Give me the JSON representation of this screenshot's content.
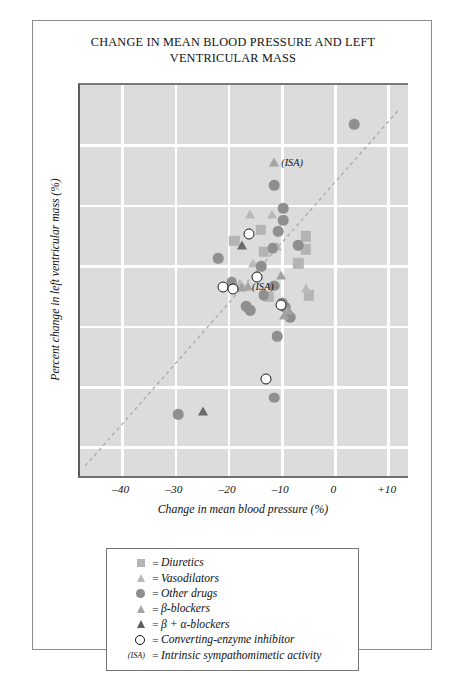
{
  "chart_data": {
    "type": "scatter",
    "title": "CHANGE IN MEAN BLOOD PRESSURE AND LEFT VENTRICULAR MASS",
    "title_lines": [
      "CHANGE IN MEAN BLOOD PRESSURE AND LEFT",
      "VENTRICULAR MASS"
    ],
    "xlabel": "Change in mean blood pressure (%)",
    "ylabel": "Percent change in left ventricular mass (%)",
    "xlim": [
      -48,
      14
    ],
    "ylim": [
      -45,
      20
    ],
    "xticks": [
      -40,
      -30,
      -20,
      -10,
      0,
      10
    ],
    "xtick_labels": [
      "–40",
      "–30",
      "–20",
      "–10",
      "0",
      "+10"
    ],
    "yticks": [
      20,
      10,
      0,
      -10,
      -20,
      -30,
      -40
    ],
    "ytick_labels": [
      "+20",
      "+10",
      "0",
      "–10",
      "–20",
      "–30",
      "–40"
    ],
    "grid": "white gridlines on gray panel, both axes",
    "legend_position": "below plot, bordered box",
    "reference_line": {
      "label": "identity line",
      "style": "dashed",
      "from": [
        -47,
        -43
      ],
      "to": [
        12,
        16
      ]
    },
    "annotations": [
      {
        "text": "(ISA)",
        "x": -11.5,
        "y": 7.2
      },
      {
        "text": "(ISA)",
        "x": -17.0,
        "y": -13.2
      }
    ],
    "series": [
      {
        "name": "Diuretics",
        "marker": "filled-square",
        "color": "#b4b4b4",
        "points": [
          [
            -19.0,
            -5.8
          ],
          [
            -14.0,
            -4.0
          ],
          [
            -13.5,
            -7.6
          ],
          [
            -5.6,
            -5.0
          ],
          [
            -5.6,
            -7.2
          ],
          [
            -7.0,
            -9.5
          ],
          [
            -12.5,
            -15.0
          ],
          [
            -5.0,
            -14.8
          ]
        ]
      },
      {
        "name": "Vasodilators",
        "marker": "filled-triangle-light",
        "color": "#b9b9b9",
        "points": [
          [
            -16.0,
            -1.4
          ],
          [
            -12.0,
            -1.4
          ],
          [
            -18.0,
            -12.8
          ],
          [
            -15.5,
            -9.5
          ],
          [
            -14.5,
            -11.2
          ],
          [
            -11.0,
            -6.6
          ],
          [
            -5.5,
            -13.5
          ]
        ]
      },
      {
        "name": "Other drugs",
        "marker": "filled-circle",
        "color": "#8f8f8f",
        "points": [
          [
            3.5,
            13.5
          ],
          [
            -11.5,
            3.4
          ],
          [
            -9.8,
            -0.4
          ],
          [
            -9.8,
            -2.4
          ],
          [
            -10.8,
            -4.2
          ],
          [
            -11.8,
            -7.0
          ],
          [
            -7.0,
            -6.5
          ],
          [
            -22.0,
            -8.6
          ],
          [
            -19.5,
            -12.6
          ],
          [
            -14.0,
            -10.0
          ],
          [
            -11.5,
            -13.2
          ],
          [
            -13.5,
            -14.8
          ],
          [
            -10.0,
            -16.0
          ],
          [
            -16.8,
            -16.6
          ],
          [
            -16.0,
            -17.2
          ],
          [
            -9.5,
            -16.8
          ],
          [
            -9.0,
            -17.8
          ],
          [
            -8.5,
            -18.4
          ],
          [
            -11.0,
            -21.5
          ],
          [
            -11.5,
            -31.7
          ],
          [
            -29.6,
            -34.4
          ]
        ]
      },
      {
        "name": "β-blockers",
        "marker": "filled-triangle-mid",
        "color": "#a3a3a3",
        "points": [
          [
            -11.5,
            7.2
          ],
          [
            -16.5,
            -13.2
          ],
          [
            -17.6,
            -13.4
          ],
          [
            -18.6,
            -13.2
          ],
          [
            -10.2,
            -11.5
          ],
          [
            -9.0,
            -17.2
          ],
          [
            -9.6,
            -18.0
          ]
        ]
      },
      {
        "name": "β + α-blockers",
        "marker": "filled-triangle-dark",
        "color": "#6a6a6a",
        "points": [
          [
            -17.6,
            -6.4
          ],
          [
            -24.8,
            -34.0
          ]
        ]
      },
      {
        "name": "Converting-enzyme inhibitor",
        "marker": "open-circle",
        "color": "#ffffff",
        "points": [
          [
            -16.2,
            -4.6
          ],
          [
            -21.2,
            -13.4
          ],
          [
            -14.8,
            -11.8
          ],
          [
            -19.2,
            -13.8
          ],
          [
            -10.2,
            -16.4
          ],
          [
            -13.0,
            -28.6
          ]
        ]
      }
    ]
  },
  "legend": {
    "rows": [
      {
        "key": "filled-square-icon",
        "eq": "=",
        "text": "Diuretics"
      },
      {
        "key": "filled-triangle-light-icon",
        "eq": "=",
        "text": "Vasodilators"
      },
      {
        "key": "filled-circle-icon",
        "eq": "=",
        "text": "Other drugs"
      },
      {
        "key": "filled-triangle-mid-icon",
        "eq": "=",
        "text": "β-blockers"
      },
      {
        "key": "filled-triangle-dark-icon",
        "eq": "=",
        "text": "β + α-blockers"
      },
      {
        "key": "open-circle-icon",
        "eq": "=",
        "text": "Converting-enzyme inhibitor"
      },
      {
        "key": "(ISA)",
        "eq": "=",
        "text": "Intrinsic sympathomimetic activity"
      }
    ]
  }
}
